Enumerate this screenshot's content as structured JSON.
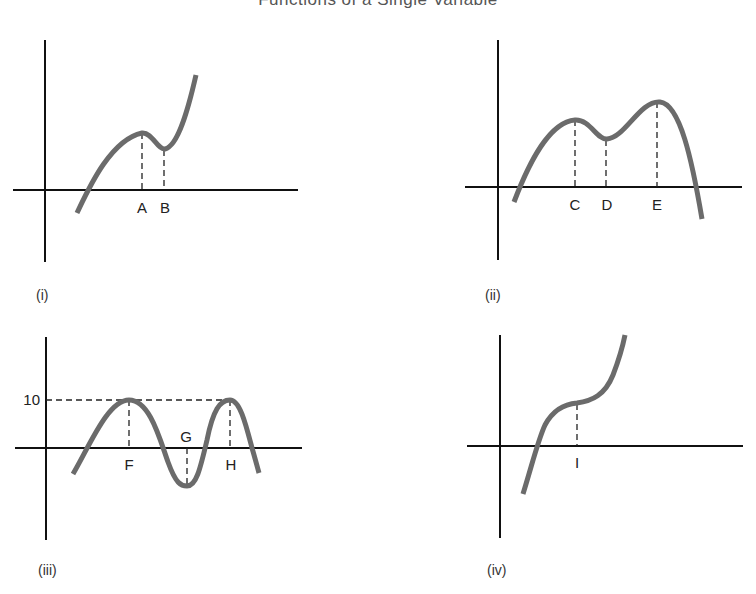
{
  "title": "Functions of a Single Variable",
  "graphs": [
    {
      "caption": "(i)",
      "points": [
        {
          "label": "A",
          "type": "local maximum"
        },
        {
          "label": "B",
          "type": "local minimum"
        }
      ]
    },
    {
      "caption": "(ii)",
      "points": [
        {
          "label": "C",
          "type": "local maximum"
        },
        {
          "label": "D",
          "type": "local minimum"
        },
        {
          "label": "E",
          "type": "global maximum"
        }
      ]
    },
    {
      "caption": "(iii)",
      "y_tick": "10",
      "points": [
        {
          "label": "F",
          "type": "maximum",
          "value": 10
        },
        {
          "label": "G",
          "type": "minimum"
        },
        {
          "label": "H",
          "type": "maximum",
          "value": 10
        }
      ]
    },
    {
      "caption": "(iv)",
      "points": [
        {
          "label": "I",
          "type": "inflection point"
        }
      ]
    }
  ],
  "colors": {
    "curve": "#6b6b6b",
    "axis": "#111111",
    "background": "#ffffff"
  }
}
